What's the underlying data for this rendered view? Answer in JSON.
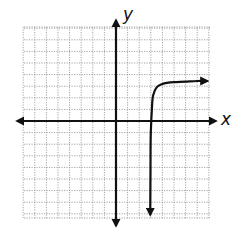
{
  "chart_data": {
    "type": "line",
    "title": "",
    "xlabel": "x",
    "ylabel": "y",
    "xlim": [
      -8,
      8
    ],
    "ylim": [
      -8,
      8
    ],
    "grid": true,
    "grid_style": "dotted",
    "grid_step": 1,
    "legend": null,
    "axes": {
      "x_arrows": "both",
      "y_arrows": "both"
    },
    "series": [
      {
        "name": "curve",
        "description": "Logarithmic-shaped curve with vertical asymptote near x = 3, rising steeply then leveling off toward y ≈ 3.5; arrows at both ends",
        "vertical_asymptote_x": 3,
        "x": [
          2.95,
          2.97,
          3.0,
          3.1,
          3.2,
          3.5,
          4.0,
          4.5,
          5.0,
          6.0,
          7.0,
          7.9
        ],
        "y": [
          -8.1,
          -4.0,
          -1.0,
          1.2,
          2.2,
          2.9,
          3.2,
          3.3,
          3.35,
          3.4,
          3.45,
          3.45
        ],
        "end_arrows": [
          "start",
          "end"
        ]
      }
    ]
  },
  "labels": {
    "x_axis": "x",
    "y_axis": "y"
  },
  "colors": {
    "axis": "#111111",
    "curve": "#111111",
    "grid": "#9a9a9a",
    "background": "#ffffff"
  }
}
